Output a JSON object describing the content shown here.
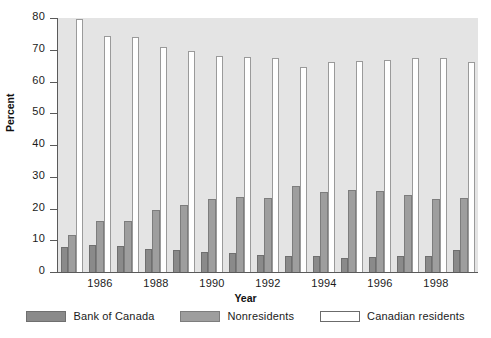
{
  "chart_data": {
    "type": "bar",
    "title": "",
    "xlabel": "Year",
    "ylabel": "Percent",
    "ylim": [
      0,
      80
    ],
    "yticks": [
      0,
      10,
      20,
      30,
      40,
      50,
      60,
      70,
      80
    ],
    "grid": false,
    "legend_position": "bottom",
    "categories": [
      "1985",
      "1986",
      "1987",
      "1988",
      "1989",
      "1990",
      "1991",
      "1992",
      "1993",
      "1994",
      "1995",
      "1996",
      "1997",
      "1998",
      "1999"
    ],
    "xtick_labels": [
      "1986",
      "1988",
      "1990",
      "1992",
      "1994",
      "1996",
      "1998"
    ],
    "xtick_categories": [
      "1986",
      "1988",
      "1990",
      "1992",
      "1994",
      "1996",
      "1998"
    ],
    "series": [
      {
        "name": "Bank of Canada",
        "color": "#8a8a8a",
        "values": [
          8.0,
          8.4,
          8.2,
          7.4,
          6.9,
          6.2,
          6.1,
          5.3,
          5.1,
          4.9,
          4.5,
          4.6,
          4.9,
          5.2,
          7.0
        ]
      },
      {
        "name": "Nonresidents",
        "color": "#9e9e9e",
        "values": [
          11.6,
          16.2,
          16.2,
          19.5,
          21.2,
          23.1,
          23.5,
          23.3,
          27.0,
          25.2,
          25.9,
          25.5,
          24.4,
          23.1,
          23.3
        ]
      },
      {
        "name": "Canadian residents",
        "color": "#ffffff",
        "values": [
          79.6,
          74.3,
          73.9,
          71.0,
          69.5,
          68.0,
          67.8,
          67.5,
          64.6,
          66.3,
          66.5,
          66.8,
          67.5,
          67.4,
          66.2
        ]
      }
    ]
  },
  "legend": {
    "items": [
      {
        "label": "Bank of Canada",
        "swatch": "boc"
      },
      {
        "label": "Nonresidents",
        "swatch": "nonres"
      },
      {
        "label": "Canadian residents",
        "swatch": "cdnres"
      }
    ]
  },
  "colors": {
    "plot_background": "#e4e4e4",
    "axis": "#5a5a5a",
    "bank_of_canada": "#8a8a8a",
    "nonresidents": "#9e9e9e",
    "canadian_residents": "#ffffff"
  }
}
